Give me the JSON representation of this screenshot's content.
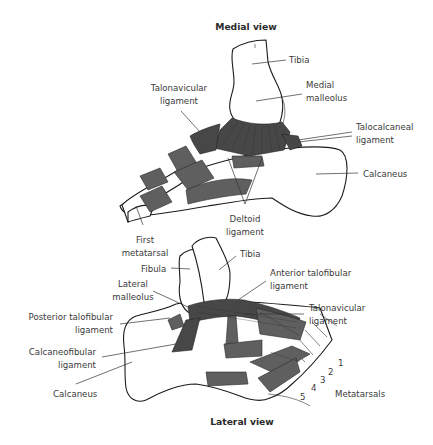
{
  "figure": {
    "medial": {
      "title": "Medial view",
      "labels": {
        "tibia": "Tibia",
        "medial_malleolus_1": "Medial",
        "medial_malleolus_2": "malleolus",
        "talonavicular_1": "Talonavicular",
        "talonavicular_2": "ligament",
        "talocalcaneal_1": "Talocalcaneal",
        "talocalcaneal_2": "ligament",
        "calcaneus": "Calcaneus",
        "deltoid_1": "Deltoid",
        "deltoid_2": "ligament",
        "first_metatarsal_1": "First",
        "first_metatarsal_2": "metatarsal"
      }
    },
    "lateral": {
      "title": "Lateral view",
      "labels": {
        "fibula": "Fibula",
        "tibia": "Tibia",
        "lateral_malleolus_1": "Lateral",
        "lateral_malleolus_2": "malleolus",
        "anterior_talofibular_1": "Anterior talofibular",
        "anterior_talofibular_2": "ligament",
        "posterior_talofibular_1": "Posterior talofibular",
        "posterior_talofibular_2": "ligament",
        "talonavicular_1": "Talonavicular",
        "talonavicular_2": "ligament",
        "calcaneofibular_1": "Calcaneofibular",
        "calcaneofibular_2": "ligament",
        "calcaneus": "Calcaneus",
        "metatarsals": "Metatarsals"
      },
      "metatarsal_numbers": [
        "1",
        "2",
        "3",
        "4",
        "5"
      ]
    }
  }
}
